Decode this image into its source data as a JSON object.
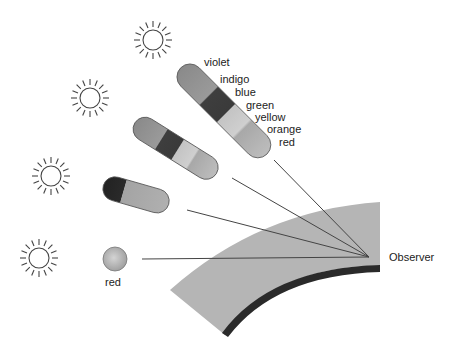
{
  "diagram": {
    "type": "rainbow-formation-illustration",
    "observer": {
      "label": "Observer",
      "x": 369,
      "y": 257
    },
    "spectrum_labels": [
      "violet",
      "indigo",
      "blue",
      "green",
      "yellow",
      "orange",
      "red"
    ],
    "single_drop_label": "red",
    "suns": [
      {
        "x": 153,
        "y": 40
      },
      {
        "x": 90,
        "y": 98
      },
      {
        "x": 51,
        "y": 176
      },
      {
        "x": 39,
        "y": 258
      }
    ],
    "colors": {
      "ground": "#b5b5b5",
      "ground_edge": "#2a2a2a",
      "line": "#444444",
      "sun_stroke": "#444444"
    }
  }
}
